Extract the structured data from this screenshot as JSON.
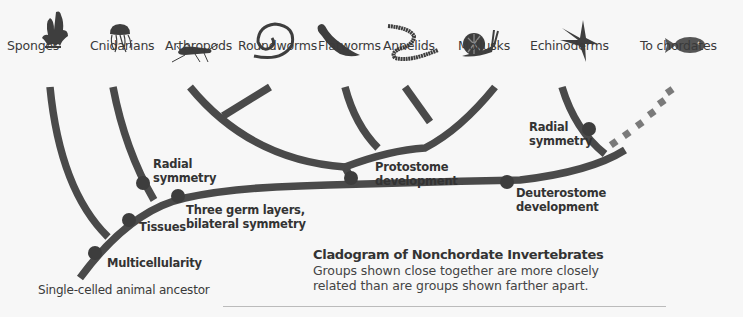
{
  "diagram": {
    "type": "cladogram",
    "title": "Cladogram of Nonchordate Invertebrates",
    "description": "Groups shown close together are more closely related than are groups shown farther apart.",
    "root_label": "Single-celled animal ancestor",
    "colors": {
      "branch": "#4a4a4a",
      "node": "#3d3d3d",
      "dashed_branch": "#7a7a7a",
      "background": "#f7f7f7",
      "text": "#333333"
    },
    "taxa": [
      {
        "label": "Sponges",
        "icon": "sponge-icon"
      },
      {
        "label": "Cnidarians",
        "icon": "jellyfish-icon"
      },
      {
        "label": "Arthropods",
        "icon": "grasshopper-icon"
      },
      {
        "label": "Roundworms",
        "icon": "roundworm-icon"
      },
      {
        "label": "Flatworms",
        "icon": "flatworm-icon"
      },
      {
        "label": "Annelids",
        "icon": "earthworm-icon"
      },
      {
        "label": "Mollusks",
        "icon": "snail-icon"
      },
      {
        "label": "Echinoderms",
        "icon": "starfish-icon"
      },
      {
        "label": "To chordates",
        "icon": "fish-icon"
      }
    ],
    "traits": [
      {
        "label": "Multicellularity"
      },
      {
        "label": "Tissues"
      },
      {
        "label_line1": "Radial",
        "label_line2": "symmetry"
      },
      {
        "label_line1": "Three germ layers,",
        "label_line2": "bilateral symmetry"
      },
      {
        "label_line1": "Protostome",
        "label_line2": "development"
      },
      {
        "label_line1": "Deuterostome",
        "label_line2": "development"
      },
      {
        "label_line1": "Radial",
        "label_line2": "symmetry"
      }
    ]
  }
}
